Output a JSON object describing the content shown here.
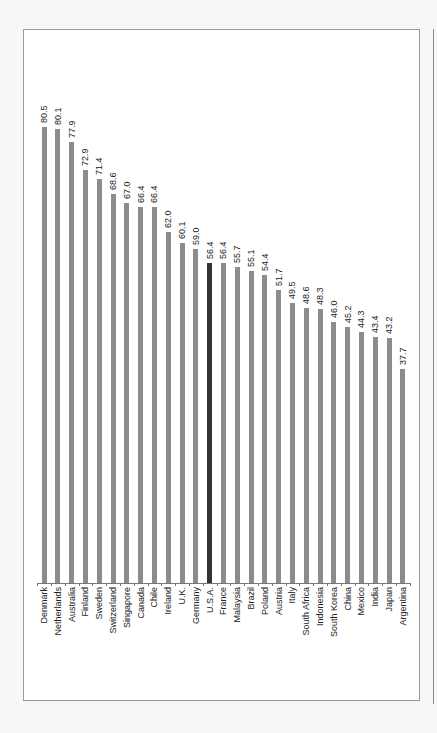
{
  "chart_data": {
    "type": "bar",
    "orientation": "vertical",
    "title": "",
    "xlabel": "",
    "ylabel": "",
    "ylim": [
      0,
      82
    ],
    "grid": false,
    "legend": null,
    "categories": [
      "Denmark",
      "Netherlands",
      "Australia",
      "Finland",
      "Sweden",
      "Switzerland",
      "Singapore",
      "Canada",
      "Chile",
      "Ireland",
      "U.K.",
      "Germany",
      "U.S.A.",
      "France",
      "Malaysia",
      "Brazil",
      "Poland",
      "Austria",
      "Italy",
      "South Africa",
      "Indonesia",
      "South Korea",
      "China",
      "Mexico",
      "India",
      "Japan",
      "Argentina"
    ],
    "values": [
      80.5,
      80.1,
      77.9,
      72.9,
      71.4,
      68.6,
      67.0,
      66.4,
      66.4,
      62.0,
      60.1,
      59.0,
      56.4,
      56.4,
      55.7,
      55.1,
      54.4,
      51.7,
      49.5,
      48.6,
      48.3,
      46.0,
      45.2,
      44.3,
      43.4,
      43.2,
      37.7
    ],
    "value_labels": [
      "80.5",
      "80.1",
      "77.9",
      "72.9",
      "71.4",
      "68.6",
      "67.0",
      "66.4",
      "66.4",
      "62.0",
      "60.1",
      "59.0",
      "56.4",
      "56.4",
      "55.7",
      "55.1",
      "54.4",
      "51.7",
      "49.5",
      "48.6",
      "48.3",
      "46.0",
      "45.2",
      "44.3",
      "43.4",
      "43.2",
      "37.7"
    ],
    "highlight_category": "U.S.A.",
    "colors": {
      "bar": "#8c8c8c",
      "highlight": "#333333"
    }
  }
}
